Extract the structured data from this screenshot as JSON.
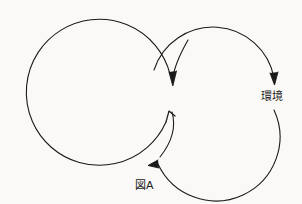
{
  "figure": {
    "title": "図A",
    "domain_kind": "diagram"
  },
  "canvas": {
    "width": 302,
    "height": 204,
    "background_color": "#faf9f7",
    "stroke_color": "#1a1a1a",
    "stroke_width": 1.1
  },
  "labels": {
    "environment": "環境",
    "figure_caption": "図A"
  },
  "shapes": {
    "left_loop": {
      "name": "left-circle-arrow",
      "center_x": 92,
      "center_y": 97,
      "radius": 73,
      "start_angle_deg": 42,
      "end_angle_deg": 315,
      "direction": "counterclockwise",
      "arrowhead": "at-end-pointing-up-right"
    },
    "right_loop": {
      "name": "right-circle-arrow",
      "center_x": 212,
      "center_y": 97,
      "radius": 62,
      "start_angle_deg": 182,
      "end_angle_deg": 92,
      "direction": "clockwise",
      "arrowhead": "at-end-pointing-down"
    },
    "inner_connector": {
      "name": "inner-connector-arrow",
      "arrowhead": "pointing-down"
    },
    "bottom_connector": {
      "name": "bottom-connector-arrow",
      "arrowhead": "pointing-left"
    }
  },
  "arrowheads": [
    {
      "name": "arrowhead-upper-inner",
      "x": 173,
      "y": 85,
      "direction": "down"
    },
    {
      "name": "arrowhead-left-loop-end",
      "x": 172,
      "y": 110,
      "direction": "up-right"
    },
    {
      "name": "arrowhead-right-outer",
      "x": 274,
      "y": 83,
      "direction": "down"
    },
    {
      "name": "arrowhead-bottom",
      "x": 152,
      "y": 163,
      "direction": "left"
    }
  ]
}
